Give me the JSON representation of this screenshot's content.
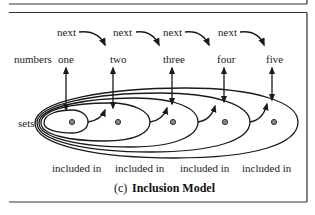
{
  "diagram": {
    "row_labels": {
      "numbers": "numbers",
      "sets": "sets"
    },
    "next_labels": [
      "next",
      "next",
      "next",
      "next"
    ],
    "numbers": [
      "one",
      "two",
      "three",
      "four",
      "five"
    ],
    "included_labels": [
      "included in",
      "included in",
      "included in",
      "included in"
    ],
    "caption": {
      "prefix": "(c)",
      "title": "Inclusion Model"
    },
    "colors": {
      "line": "#1a1a1a",
      "dot_fill": "#888888",
      "background": "#ffffff"
    }
  }
}
